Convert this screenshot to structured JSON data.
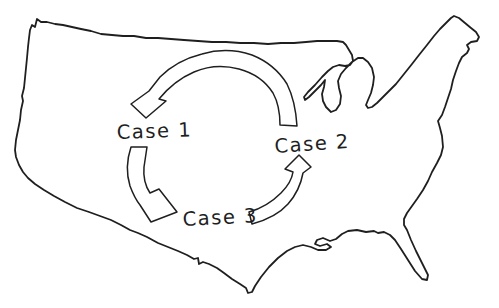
{
  "figure": {
    "background_color": "#ffffff",
    "ink_color": "#1f1f1f",
    "map": {
      "name": "united-states-outline"
    },
    "nodes": [
      {
        "id": "case-1",
        "label": "Case 1"
      },
      {
        "id": "case-2",
        "label": "Case 2"
      },
      {
        "id": "case-3",
        "label": "Case 3"
      }
    ],
    "edges": [
      {
        "from": "case-2",
        "to": "case-1",
        "position": "top-arc",
        "arrow_style": "outlined-curved-arrow"
      },
      {
        "from": "case-1",
        "to": "case-3",
        "position": "left-arc",
        "arrow_style": "outlined-curved-arrow"
      },
      {
        "from": "case-3",
        "to": "case-2",
        "position": "right-arc",
        "arrow_style": "outlined-curved-arrow"
      }
    ]
  }
}
